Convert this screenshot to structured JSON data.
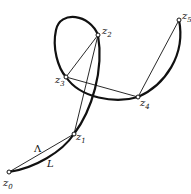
{
  "diagram": {
    "points": [
      {
        "id": "z0",
        "label": "z",
        "sub": "0",
        "x": 9,
        "y": 172
      },
      {
        "id": "z1",
        "label": "z",
        "sub": "1",
        "x": 74,
        "y": 134
      },
      {
        "id": "z2",
        "label": "z",
        "sub": "2",
        "x": 98,
        "y": 35
      },
      {
        "id": "z3",
        "label": "z",
        "sub": "3",
        "x": 66,
        "y": 77
      },
      {
        "id": "z4",
        "label": "z",
        "sub": "4",
        "x": 138,
        "y": 97
      },
      {
        "id": "z5",
        "label": "z",
        "sub": "5",
        "x": 179,
        "y": 20
      }
    ],
    "chord_label": "Λ",
    "arc_label": "L"
  }
}
